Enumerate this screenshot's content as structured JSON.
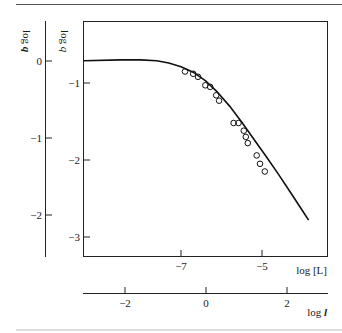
{
  "chart_data": {
    "type": "line",
    "title": "",
    "xlabel": "log [L]",
    "xlabel_secondary": "log l",
    "ylabel": "log q",
    "ylabel_secondary": "log q",
    "x_ticks": [
      -7,
      -5
    ],
    "x_tick_labels": [
      "−7",
      "−5"
    ],
    "x_secondary_ticks": [
      -2,
      0,
      2
    ],
    "x_secondary_tick_labels": [
      "−2",
      "0",
      "2"
    ],
    "y_ticks": [
      -1,
      -2,
      -3
    ],
    "y_tick_labels": [
      "−1",
      "−2",
      "−3"
    ],
    "y_secondary_ticks": [
      0,
      -1,
      -2
    ],
    "y_secondary_tick_labels": [
      "0",
      "−1",
      "−2"
    ],
    "xlim": [
      -9.4,
      -3.4
    ],
    "ylim": [
      -3.25,
      0.2
    ],
    "grid": false,
    "legend": null,
    "series": [
      {
        "name": "fitted curve",
        "style": "line",
        "x": [
          -9.4,
          -8.5,
          -8.0,
          -7.6,
          -7.3,
          -7.0,
          -6.7,
          -6.4,
          -6.1,
          -5.8,
          -5.5,
          -5.2,
          -4.9,
          -4.6,
          -4.3,
          -4.0,
          -3.85
        ],
        "y": [
          -0.71,
          -0.7,
          -0.7,
          -0.71,
          -0.74,
          -0.79,
          -0.86,
          -0.97,
          -1.12,
          -1.3,
          -1.51,
          -1.73,
          -1.95,
          -2.18,
          -2.42,
          -2.66,
          -2.78
        ]
      },
      {
        "name": "observed",
        "style": "open-circle",
        "x": [
          -6.9,
          -6.7,
          -6.58,
          -6.4,
          -6.28,
          -6.13,
          -6.06,
          -5.7,
          -5.58,
          -5.45,
          -5.4,
          -5.35,
          -5.13,
          -5.05,
          -4.93
        ],
        "y": [
          -0.85,
          -0.88,
          -0.92,
          -1.03,
          -1.05,
          -1.16,
          -1.23,
          -1.52,
          -1.52,
          -1.62,
          -1.7,
          -1.78,
          -1.94,
          -2.05,
          -2.15
        ]
      }
    ]
  },
  "labels": {
    "y_outer_title": "log q",
    "y_inner_title": "log q",
    "x_main_title": "log [L]",
    "x_secondary_title": "log l"
  }
}
